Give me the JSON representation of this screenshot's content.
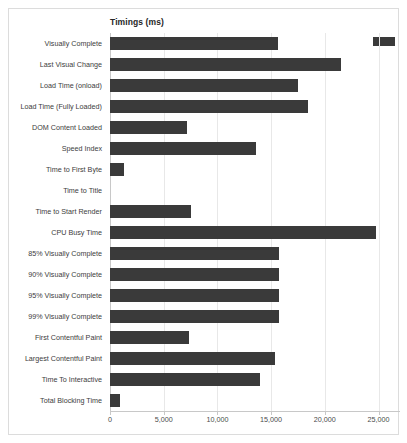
{
  "chart_data": {
    "type": "bar",
    "orientation": "horizontal",
    "title": "Timings (ms)",
    "xlabel": "",
    "ylabel": "",
    "xlim": [
      0,
      27000
    ],
    "xticks": [
      0,
      5000,
      10000,
      15000,
      20000,
      25000
    ],
    "xtick_labels": [
      "0",
      "5,000",
      "10,000",
      "15,000",
      "20,000",
      "25,000"
    ],
    "grid": "vertical",
    "legend": {
      "position": "top-right",
      "entries": [
        {
          "label": "",
          "color": "#3a3a3a"
        }
      ]
    },
    "bar_color": "#3a3a3a",
    "categories": [
      "Visually Complete",
      "Last Visual Change",
      "Load Time (onload)",
      "Load Time (Fully Loaded)",
      "DOM Content Loaded",
      "Speed Index",
      "Time to First Byte",
      "Time to Title",
      "Time to Start Render",
      "CPU Busy Time",
      "85% Visually Complete",
      "90% Visually Complete",
      "95% Visually Complete",
      "99% Visually Complete",
      "First Contentful Paint",
      "Largest Contentful Paint",
      "Time To Interactive",
      "Total Blocking Time"
    ],
    "values": [
      15600,
      21500,
      17500,
      18400,
      7200,
      13600,
      1300,
      0,
      7500,
      24800,
      15700,
      15700,
      15700,
      15700,
      7400,
      15400,
      14000,
      900
    ]
  }
}
